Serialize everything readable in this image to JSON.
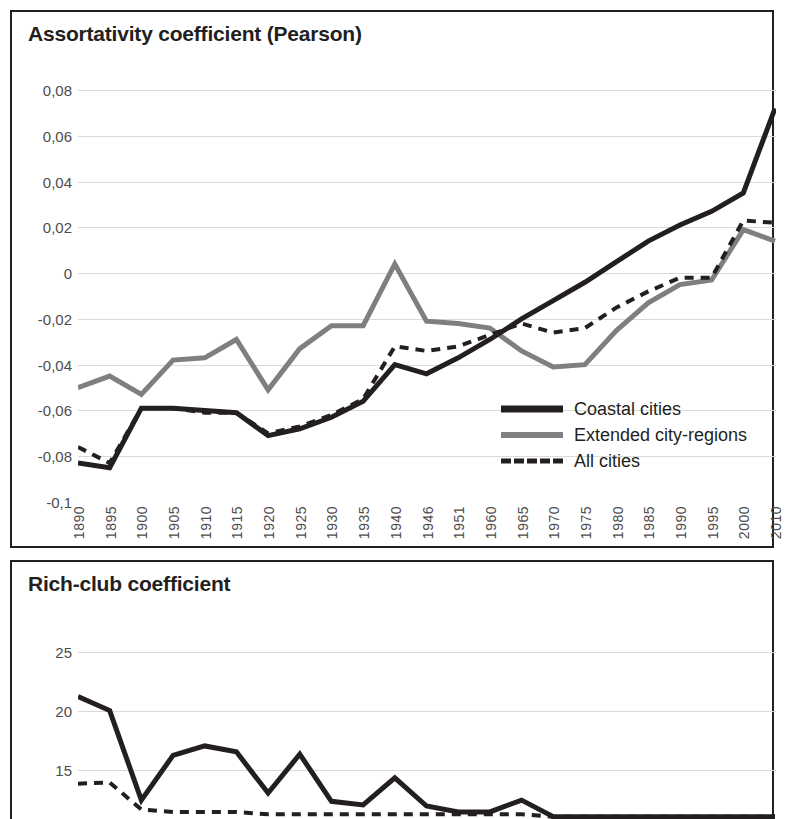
{
  "panels": [
    {
      "title": "Assortativity coefficient (Pearson)"
    },
    {
      "title": "Rich-club coefficient"
    }
  ],
  "legend": {
    "items": [
      {
        "label": "Coastal cities",
        "style": "solid-black",
        "color": "#231f20"
      },
      {
        "label": "Extended city-regions",
        "style": "solid-gray",
        "color": "#7f7f7f"
      },
      {
        "label": "All cities",
        "style": "dashed-black",
        "color": "#231f20"
      }
    ]
  },
  "chart_data": [
    {
      "type": "line",
      "title": "Assortativity coefficient (Pearson)",
      "xlabel": "",
      "ylabel": "",
      "ylim": [
        -0.1,
        0.08
      ],
      "yticks": [
        0.08,
        0.06,
        0.04,
        0.02,
        0,
        -0.02,
        -0.04,
        -0.06,
        -0.08,
        -0.1
      ],
      "ytick_labels": [
        "0,08",
        "0,06",
        "0,04",
        "0,02",
        "0",
        "-0,02",
        "-0,04",
        "-0,06",
        "-0,08",
        "-0,1"
      ],
      "grid": true,
      "legend_position": "inside-bottom-right",
      "categories": [
        1890,
        1895,
        1900,
        1905,
        1910,
        1915,
        1920,
        1925,
        1930,
        1935,
        1940,
        1946,
        1951,
        1960,
        1965,
        1970,
        1975,
        1980,
        1985,
        1990,
        1995,
        2000,
        2010
      ],
      "series": [
        {
          "name": "Coastal cities",
          "color": "#231f20",
          "style": "solid",
          "width": 5,
          "values": [
            -0.083,
            -0.085,
            -0.059,
            -0.059,
            -0.06,
            -0.061,
            -0.071,
            -0.068,
            -0.063,
            -0.056,
            -0.04,
            -0.044,
            -0.037,
            -0.029,
            -0.02,
            -0.012,
            -0.004,
            0.005,
            0.014,
            0.021,
            0.027,
            0.035,
            0.072
          ]
        },
        {
          "name": "Extended city-regions",
          "color": "#7f7f7f",
          "style": "solid",
          "width": 5,
          "values": [
            -0.05,
            -0.045,
            -0.053,
            -0.038,
            -0.037,
            -0.029,
            -0.051,
            -0.033,
            -0.023,
            -0.023,
            0.004,
            -0.021,
            -0.022,
            -0.024,
            -0.034,
            -0.041,
            -0.04,
            -0.025,
            -0.013,
            -0.005,
            -0.003,
            0.019,
            0.014
          ]
        },
        {
          "name": "All cities",
          "color": "#231f20",
          "style": "dashed",
          "width": 4,
          "values": [
            -0.076,
            -0.083,
            -0.059,
            -0.059,
            -0.061,
            -0.061,
            -0.07,
            -0.067,
            -0.062,
            -0.055,
            -0.032,
            -0.034,
            -0.032,
            -0.027,
            -0.022,
            -0.026,
            -0.024,
            -0.015,
            -0.008,
            -0.002,
            -0.002,
            0.023,
            0.022
          ]
        }
      ]
    },
    {
      "type": "line",
      "title": "Rich-club coefficient",
      "xlabel": "",
      "ylabel": "",
      "ylim": [
        10.8,
        26.5
      ],
      "yticks": [
        25,
        20,
        15
      ],
      "ytick_labels": [
        "25",
        "20",
        "15"
      ],
      "grid": true,
      "note": "Chart is cut off at the bottom edge of the screenshot; only the upper portion is visible.",
      "categories": [
        1890,
        1895,
        1900,
        1905,
        1910,
        1915,
        1920,
        1925,
        1930,
        1935,
        1940,
        1946,
        1951,
        1960,
        1965,
        1970,
        1975,
        1980,
        1985,
        1990,
        1995,
        2000,
        2010
      ],
      "series": [
        {
          "name": "Coastal cities",
          "color": "#231f20",
          "style": "solid",
          "width": 5,
          "values": [
            21.2,
            20.0,
            12.4,
            16.2,
            17.0,
            16.5,
            13.0,
            16.3,
            12.3,
            12.0,
            14.3,
            11.9,
            11.4,
            11.4,
            12.4,
            11.0,
            11.0,
            11.0,
            11.0,
            11.0,
            11.0,
            11.0,
            11.0
          ]
        },
        {
          "name": "All cities",
          "color": "#231f20",
          "style": "dashed",
          "width": 4,
          "values": [
            13.8,
            13.9,
            11.6,
            11.4,
            11.4,
            11.4,
            11.2,
            11.2,
            11.2,
            11.2,
            11.2,
            11.2,
            11.2,
            11.2,
            11.2,
            11.0,
            11.0,
            11.0,
            11.0,
            11.0,
            11.0,
            11.0,
            11.0
          ]
        }
      ]
    }
  ]
}
